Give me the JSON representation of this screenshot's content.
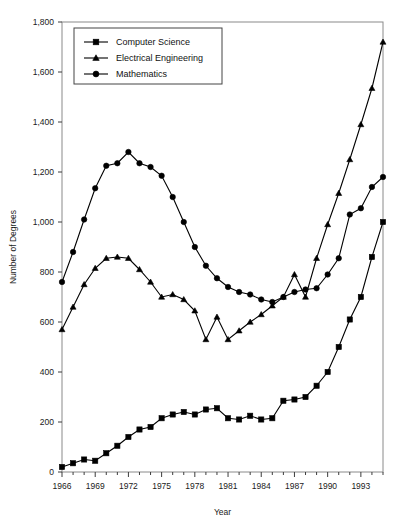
{
  "chart_data": {
    "type": "line",
    "title": "",
    "xlabel": "Year",
    "ylabel": "Number of Degrees",
    "xlim": [
      1966,
      1995
    ],
    "ylim": [
      0,
      1800
    ],
    "ytick_step": 200,
    "ytick_labels": [
      "0",
      "200",
      "400",
      "600",
      "800",
      "1,000",
      "1,200",
      "1,400",
      "1,600",
      "1,800"
    ],
    "xtick_labels": [
      "1966",
      "1969",
      "1972",
      "1975",
      "1978",
      "1981",
      "1984",
      "1987",
      "1990",
      "1993"
    ],
    "xtick_values": [
      1966,
      1969,
      1972,
      1975,
      1978,
      1981,
      1984,
      1987,
      1990,
      1993
    ],
    "grid": false,
    "legend_position": "top-left-inside",
    "x": [
      1966,
      1967,
      1968,
      1969,
      1970,
      1971,
      1972,
      1973,
      1974,
      1975,
      1976,
      1977,
      1978,
      1979,
      1980,
      1981,
      1982,
      1983,
      1984,
      1985,
      1986,
      1987,
      1988,
      1989,
      1990,
      1991,
      1992,
      1993,
      1994,
      1995
    ],
    "series": [
      {
        "name": "Computer Science",
        "marker": "square",
        "values": [
          20,
          35,
          50,
          45,
          75,
          105,
          140,
          170,
          180,
          215,
          230,
          240,
          230,
          250,
          255,
          215,
          210,
          225,
          210,
          215,
          285,
          290,
          300,
          345,
          400,
          500,
          610,
          700,
          860,
          1000
        ]
      },
      {
        "name": "Electrical Engineering",
        "marker": "triangle",
        "values": [
          570,
          660,
          750,
          815,
          855,
          860,
          855,
          810,
          760,
          700,
          710,
          690,
          645,
          530,
          620,
          530,
          565,
          600,
          630,
          665,
          700,
          790,
          700,
          855,
          990,
          1115,
          1250,
          1390,
          1535,
          1720
        ]
      },
      {
        "name": "Mathematics",
        "marker": "circle",
        "values": [
          760,
          880,
          1010,
          1135,
          1225,
          1235,
          1280,
          1235,
          1220,
          1185,
          1100,
          1000,
          900,
          825,
          775,
          740,
          720,
          710,
          690,
          680,
          700,
          720,
          730,
          735,
          790,
          855,
          1030,
          1055,
          1140,
          1180
        ]
      }
    ]
  },
  "legend": {
    "items": [
      {
        "label": "Computer Science"
      },
      {
        "label": "Electrical Engineering"
      },
      {
        "label": "Mathematics"
      }
    ]
  },
  "axes": {
    "y_title": "Number of Degrees",
    "x_title": "Year"
  }
}
